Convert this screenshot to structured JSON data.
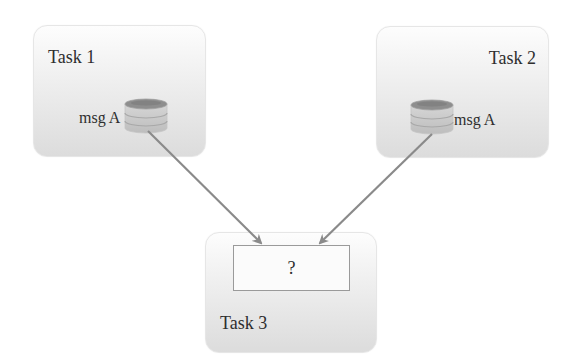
{
  "diagram": {
    "tasks": [
      {
        "id": "task1",
        "title": "Task 1",
        "message_label": "msg A"
      },
      {
        "id": "task2",
        "title": "Task 2",
        "message_label": "msg A"
      },
      {
        "id": "task3",
        "title": "Task 3",
        "inbox_label": "?"
      }
    ],
    "edges": [
      {
        "from": "task1.msg A",
        "to": "task3.inbox"
      },
      {
        "from": "task2.msg A",
        "to": "task3.inbox"
      }
    ],
    "icons": {
      "message_store": "database-stack-icon"
    },
    "colors": {
      "box_top": "#fdfdfd",
      "box_bottom": "#dcdcdc",
      "arrow": "#8a8a8a",
      "text": "#2e2e2e",
      "disk_dark": "#8c8c8c",
      "disk_light": "#c8c8c8"
    }
  }
}
